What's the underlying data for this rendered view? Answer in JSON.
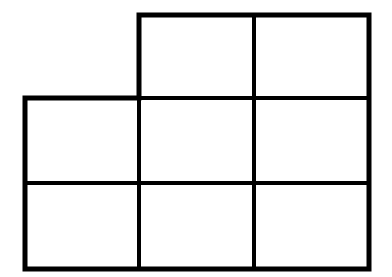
{
  "diagram": {
    "rows": [
      {
        "row": 1,
        "cells": [
          2,
          3
        ]
      },
      {
        "row": 2,
        "cells": [
          1,
          2,
          3
        ]
      },
      {
        "row": 3,
        "cells": [
          1,
          2,
          3
        ]
      }
    ],
    "cell_count": 8,
    "line_color": "#000000",
    "background": "#ffffff"
  }
}
